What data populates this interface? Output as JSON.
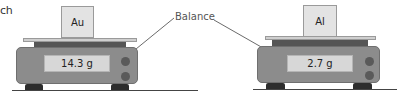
{
  "fragment_text": "ch",
  "callout": {
    "label": "Balance"
  },
  "balances": [
    {
      "sample_label": "Au",
      "reading": "14.3 g"
    },
    {
      "sample_label": "Al",
      "reading": "2.7 g"
    }
  ],
  "colors": {
    "body": "#8c8c8c",
    "display": "#d7d7d7",
    "platform": "#cfcfcf",
    "band": "#555555",
    "feet": "#2d2d2d",
    "sample": "#e3e3e3"
  }
}
